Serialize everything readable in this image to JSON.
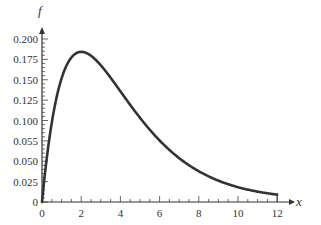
{
  "chart_data": {
    "type": "line",
    "title": "",
    "xlabel": "x",
    "ylabel": "f",
    "xlim": [
      0,
      12
    ],
    "ylim": [
      0,
      0.2
    ],
    "grid": false,
    "legend": null,
    "x_ticks": [
      0,
      2,
      4,
      6,
      8,
      10,
      12
    ],
    "x_tick_labels": [
      "0",
      "2",
      "4",
      "6",
      "8",
      "10",
      "12"
    ],
    "x_minor_step": 0.5,
    "y_ticks": [
      0,
      0.025,
      0.05,
      0.075,
      0.1,
      0.125,
      0.15,
      0.175,
      0.2
    ],
    "y_tick_labels": [
      "0",
      "0.025",
      "0.050",
      "0.055",
      "0.100",
      "0.125",
      "0.150",
      "0.175",
      "0.200"
    ],
    "y_minor_step": 0.005,
    "series": [
      {
        "name": "f(x)",
        "color": "#333333",
        "x": [
          0,
          0.5,
          1,
          1.5,
          2,
          2.5,
          3,
          3.5,
          4,
          5,
          6,
          7,
          8,
          9,
          10,
          11,
          12
        ],
        "values": [
          0,
          0.097,
          0.152,
          0.177,
          0.184,
          0.179,
          0.167,
          0.152,
          0.135,
          0.103,
          0.075,
          0.053,
          0.037,
          0.025,
          0.017,
          0.011,
          0.009
        ]
      }
    ]
  }
}
